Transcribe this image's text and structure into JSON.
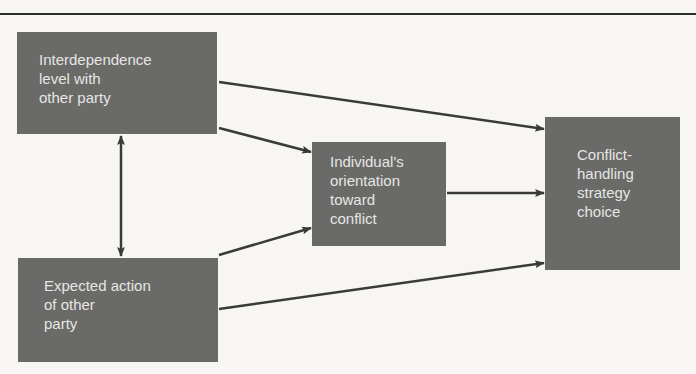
{
  "diagram": {
    "type": "flow",
    "nodes": [
      {
        "id": "interdependence",
        "lines": [
          "Interdependence",
          "level with",
          "other party"
        ]
      },
      {
        "id": "expected_action",
        "lines": [
          "Expected action",
          "of other",
          "party"
        ]
      },
      {
        "id": "orientation",
        "lines": [
          "Individual's",
          "orientation",
          "toward",
          "conflict"
        ]
      },
      {
        "id": "strategy_choice",
        "lines": [
          "Conflict-",
          "handling",
          "strategy",
          "choice"
        ]
      }
    ],
    "edges": [
      {
        "from": "interdependence",
        "to": "strategy_choice",
        "direction": "forward"
      },
      {
        "from": "interdependence",
        "to": "orientation",
        "direction": "forward"
      },
      {
        "from": "expected_action",
        "to": "orientation",
        "direction": "forward"
      },
      {
        "from": "expected_action",
        "to": "strategy_choice",
        "direction": "forward"
      },
      {
        "from": "orientation",
        "to": "strategy_choice",
        "direction": "forward"
      },
      {
        "from": "interdependence",
        "to": "expected_action",
        "direction": "bidirectional"
      }
    ],
    "colors": {
      "box_fill": "#6a6a68",
      "box_text": "#e6e6e3",
      "arrow": "#3a3a3a",
      "background": "#f7f6f3"
    }
  }
}
